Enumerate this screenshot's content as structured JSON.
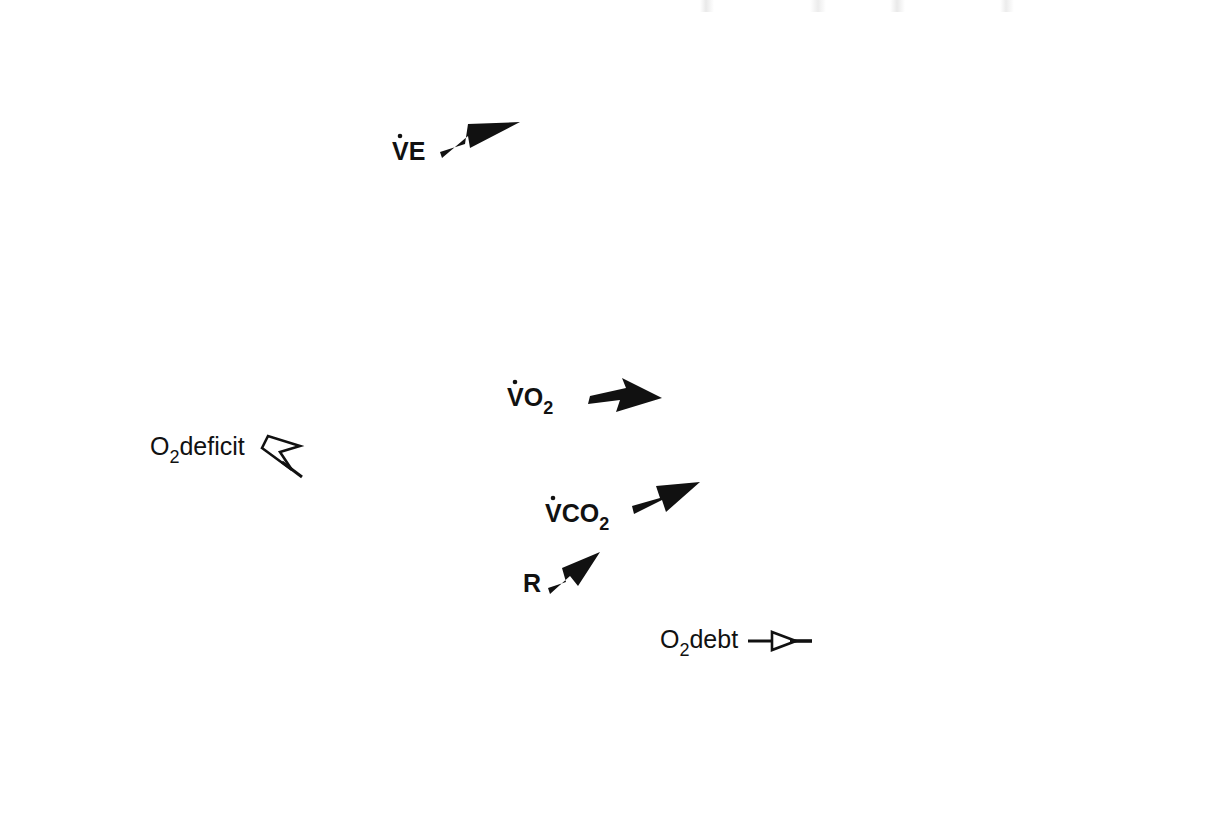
{
  "figure": {
    "title": "",
    "background": "#ffffff",
    "ink_color": "#111111"
  },
  "axes": {
    "y_title_parts": {
      "p1": "V",
      "p2": "O",
      "p3": "2",
      "p4": " & V",
      "p5": "CO",
      "p6": "2",
      "p7": ", L/min; V",
      "p8": "E 10 ∞ L/min"
    },
    "y_title_plain": "V̇O2 & V̇CO2, L/min; V̇E 10 ∞ L/min",
    "x_title": "Minutes",
    "y_ticks": [
      "0",
      "0.5",
      "1",
      "1.5",
      "2",
      "2.5",
      "3",
      "3.5"
    ],
    "y_tick_values": [
      0,
      0.5,
      1,
      1.5,
      2,
      2.5,
      3,
      3.5
    ],
    "x_ticks": [
      "-2",
      "0",
      "2",
      "4",
      "6",
      "8",
      "10"
    ],
    "x_tick_values": [
      -2,
      0,
      2,
      4,
      6,
      8,
      10
    ],
    "ylim": [
      0,
      3.5
    ],
    "xlim": [
      -2,
      10
    ],
    "grid": false
  },
  "annotations": {
    "exercise_bar_label": "EXERCISE",
    "exercise_start": 0,
    "exercise_end": 6,
    "o2_deficit": {
      "label_parts": {
        "a": "O",
        "b": "2",
        "c": "deficit"
      },
      "label": "O2deficit",
      "arrow": "hollow-arrow-right"
    },
    "o2_debt": {
      "label_parts": {
        "a": "O",
        "b": "2",
        "c": "debt"
      },
      "label": "O2debt",
      "arrow": "hollow-arrow-right"
    },
    "series_callouts": [
      {
        "name": "VE",
        "label_parts": {
          "a": "V",
          "b": "E"
        },
        "label": "V̇E",
        "arrow": "solid-arrow-upright"
      },
      {
        "name": "VO2",
        "label_parts": {
          "a": "V",
          "b": "O",
          "c": "2"
        },
        "label": "V̇O2",
        "arrow": "solid-arrow-right"
      },
      {
        "name": "VCO2",
        "label_parts": {
          "a": "V",
          "b": "CO",
          "c": "2"
        },
        "label": "V̇CO2",
        "arrow": "solid-arrow-upright"
      },
      {
        "name": "R",
        "label_parts": {
          "a": "R"
        },
        "label": "R",
        "arrow": "solid-arrow-upright"
      }
    ]
  },
  "chart_data": {
    "type": "line",
    "title": "",
    "subtitle": "",
    "xlabel": "Minutes",
    "ylabel": "V̇O2 & V̇CO2, L/min; V̇E 10 ∞ L/min",
    "xlim": [
      -2,
      10
    ],
    "ylim": [
      0,
      3.5
    ],
    "grid": false,
    "legend_position": "inline-callouts",
    "x_unit": "minutes",
    "x": [
      -2.0,
      -1.8,
      -1.6,
      -1.4,
      -1.2,
      -1.0,
      -0.8,
      -0.6,
      -0.4,
      -0.2,
      0.0,
      0.2,
      0.4,
      0.6,
      0.8,
      1.0,
      1.2,
      1.4,
      1.6,
      1.8,
      2.0,
      2.2,
      2.4,
      2.6,
      2.8,
      3.0,
      3.2,
      3.4,
      3.6,
      3.8,
      4.0,
      4.2,
      4.4,
      4.6,
      4.8,
      5.0,
      5.2,
      5.4,
      5.6,
      5.8,
      6.0,
      6.2,
      6.4,
      6.6,
      6.8,
      7.0,
      7.2,
      7.4,
      7.6,
      7.8,
      8.0,
      8.2,
      8.4,
      8.6,
      8.8,
      9.0,
      9.2,
      9.4,
      9.6,
      9.8,
      10.0
    ],
    "series": [
      {
        "name": "VE",
        "label": "V̇E",
        "units": "L/min divided by 10",
        "marker": "filled-square-small",
        "line": "solid-thin",
        "values": [
          0.7,
          0.7,
          0.71,
          0.7,
          0.7,
          0.71,
          0.7,
          0.7,
          0.71,
          0.7,
          0.7,
          0.72,
          0.95,
          1.25,
          1.55,
          1.8,
          2.05,
          2.3,
          2.52,
          2.7,
          2.85,
          2.86,
          2.95,
          3.0,
          3.08,
          3.12,
          3.08,
          3.18,
          3.15,
          3.22,
          3.2,
          3.34,
          3.26,
          3.34,
          3.28,
          3.38,
          3.36,
          3.4,
          3.42,
          3.44,
          3.4,
          3.38,
          3.41,
          3.4,
          3.2,
          2.96,
          2.72,
          2.48,
          2.26,
          2.06,
          1.86,
          1.66,
          1.48,
          1.3,
          1.14,
          1.0,
          0.92,
          0.86,
          0.82,
          0.78,
          0.75
        ]
      },
      {
        "name": "VO2",
        "label": "V̇O2",
        "units": "L/min",
        "marker": "open-square",
        "line": "solid-thin",
        "values": [
          0.3,
          0.3,
          0.31,
          0.3,
          0.3,
          0.31,
          0.3,
          0.31,
          0.3,
          0.3,
          0.31,
          0.62,
          0.68,
          0.85,
          1.0,
          1.12,
          1.22,
          1.3,
          1.36,
          1.4,
          1.44,
          1.46,
          1.48,
          1.5,
          1.51,
          1.51,
          1.52,
          1.52,
          1.51,
          1.52,
          1.52,
          1.52,
          1.52,
          1.52,
          1.53,
          1.52,
          1.52,
          1.52,
          1.52,
          1.52,
          1.52,
          1.3,
          1.1,
          0.92,
          0.78,
          0.66,
          0.58,
          0.52,
          0.47,
          0.43,
          0.4,
          0.38,
          0.36,
          0.35,
          0.34,
          0.33,
          0.32,
          0.32,
          0.31,
          0.31,
          0.31
        ]
      },
      {
        "name": "VCO2",
        "label": "V̇CO2",
        "units": "L/min",
        "marker": "filled-circle",
        "line": "solid-thin",
        "values": [
          0.25,
          0.25,
          0.26,
          0.25,
          0.25,
          0.26,
          0.25,
          0.26,
          0.25,
          0.25,
          0.26,
          0.52,
          0.56,
          0.62,
          0.72,
          0.82,
          0.9,
          0.98,
          1.08,
          1.14,
          1.18,
          1.22,
          1.17,
          1.22,
          1.27,
          1.3,
          1.28,
          1.3,
          1.34,
          1.32,
          1.34,
          1.33,
          1.35,
          1.34,
          1.37,
          1.36,
          1.38,
          1.36,
          1.37,
          1.36,
          1.36,
          1.22,
          1.04,
          0.88,
          0.74,
          0.64,
          0.56,
          0.5,
          0.45,
          0.41,
          0.38,
          0.36,
          0.34,
          0.33,
          0.32,
          0.31,
          0.3,
          0.3,
          0.29,
          0.29,
          0.29
        ]
      },
      {
        "name": "R",
        "label": "R",
        "units": "ratio",
        "marker": "thick-step",
        "line": "solid-thick-step",
        "values": [
          0.8,
          0.8,
          0.8,
          0.85,
          0.84,
          0.78,
          0.78,
          0.81,
          0.81,
          0.8,
          0.8,
          0.8,
          0.8,
          0.8,
          0.8,
          0.8,
          0.79,
          0.8,
          0.8,
          0.8,
          0.8,
          0.81,
          0.81,
          0.83,
          0.83,
          0.86,
          0.86,
          0.89,
          0.88,
          0.88,
          0.89,
          0.89,
          0.9,
          0.9,
          0.9,
          0.9,
          0.9,
          0.9,
          0.9,
          0.9,
          0.9,
          0.92,
          0.93,
          0.93,
          0.91,
          0.9,
          0.89,
          0.88,
          0.88,
          0.87,
          0.86,
          0.86,
          0.85,
          0.84,
          0.84,
          0.83,
          0.83,
          0.83,
          0.83,
          0.83,
          0.83
        ]
      }
    ],
    "shaded_regions": [
      {
        "name": "O2 deficit",
        "label": "O2deficit",
        "x_range": [
          0,
          2.6
        ],
        "y_top": 1.52,
        "hatch": "dotted-diagonal",
        "description": "Area between the VO2 steady-state level (1.52 L/min) and the rising VO2 curve from exercise onset."
      },
      {
        "name": "O2 debt",
        "label": "O2debt",
        "x_range": [
          6,
          8.2
        ],
        "y_bottom": 0.31,
        "hatch": "dotted-diagonal",
        "description": "Area between the falling VO2 recovery curve and the resting baseline (0.31 L/min) after exercise ends."
      }
    ]
  }
}
